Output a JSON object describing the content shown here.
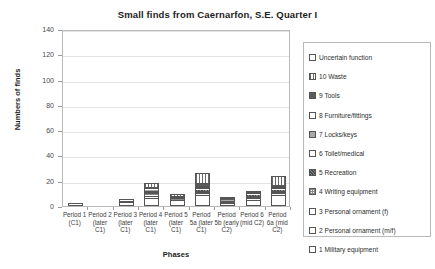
{
  "chart_data": {
    "type": "bar",
    "title": "Small finds from Caernarfon, S.E. Quarter I",
    "xlabel": "Phases",
    "ylabel": "Numbers of finds",
    "ylim": [
      0,
      140
    ],
    "yticks": [
      0,
      20,
      40,
      60,
      80,
      100,
      120,
      140
    ],
    "grid": true,
    "stacked": true,
    "legend_position": "right",
    "categories": [
      "Period 1 (C1)",
      "Period 2 (later C1)",
      "Period 3 (later C1)",
      "Period 4 (later C1)",
      "Period 5 (later C1)",
      "Period 5a (later C1)",
      "Period 5b (early C2)",
      "Period 6 (mid C2)",
      "Period 6a (mid C2)"
    ],
    "series": [
      {
        "name": "1 Military equipment",
        "pattern": "p-empty",
        "values": [
          2,
          0,
          3,
          6,
          5,
          9,
          2,
          5,
          9
        ]
      },
      {
        "name": "2 Personal ornament (m/f)",
        "pattern": "p-empty",
        "values": [
          0,
          0,
          0,
          2,
          0,
          1,
          0,
          1,
          1
        ]
      },
      {
        "name": "3 Personal ornament (f)",
        "pattern": "p-empty",
        "values": [
          0,
          0,
          0,
          1,
          0,
          1,
          0,
          1,
          1
        ]
      },
      {
        "name": "4 Writing equipment",
        "pattern": "p-checker",
        "values": [
          0,
          0,
          1,
          1,
          1,
          1,
          1,
          1,
          1
        ]
      },
      {
        "name": "5 Recreation",
        "pattern": "p-dark-dot",
        "values": [
          0,
          0,
          0,
          1,
          0,
          1,
          0,
          1,
          1
        ]
      },
      {
        "name": "6 Toilet/medical",
        "pattern": "p-empty",
        "values": [
          0,
          0,
          1,
          1,
          1,
          1,
          1,
          1,
          1
        ]
      },
      {
        "name": "7 Locks/keys",
        "pattern": "p-mid",
        "values": [
          0,
          0,
          0,
          1,
          0,
          1,
          1,
          1,
          1
        ]
      },
      {
        "name": "8 Furniture/fittings",
        "pattern": "p-empty",
        "values": [
          0,
          0,
          0,
          1,
          1,
          1,
          0,
          0,
          1
        ]
      },
      {
        "name": "9 Tools",
        "pattern": "p-dark",
        "values": [
          0,
          0,
          0,
          1,
          0,
          2,
          1,
          1,
          1
        ]
      },
      {
        "name": "10 Waste",
        "pattern": "p-vert",
        "values": [
          0,
          0,
          0,
          3,
          1,
          8,
          1,
          0,
          7
        ]
      },
      {
        "name": "Uncertain function",
        "pattern": "p-empty",
        "values": [
          0,
          0,
          0,
          0,
          0,
          0,
          0,
          0,
          0
        ]
      }
    ],
    "totals": [
      2,
      0,
      5,
      18,
      9,
      27,
      8,
      12,
      24
    ]
  },
  "legend": {
    "entries": [
      {
        "label": "Uncertain function",
        "pattern": "p-empty"
      },
      {
        "label": "10 Waste",
        "pattern": "p-vert"
      },
      {
        "label": "9 Tools",
        "pattern": "p-dark"
      },
      {
        "label": "8 Furniture/fittings",
        "pattern": "p-empty"
      },
      {
        "label": "7 Locks/keys",
        "pattern": "p-mid"
      },
      {
        "label": "6 Toilet/medical",
        "pattern": "p-empty"
      },
      {
        "label": "5 Recreation",
        "pattern": "p-dark-dot"
      },
      {
        "label": "4 Writing equipment",
        "pattern": "p-checker"
      },
      {
        "label": "3 Personal ornament (f)",
        "pattern": "p-empty"
      },
      {
        "label": "2 Personal ornament (m/f)",
        "pattern": "p-empty"
      },
      {
        "label": "1 Military equipment",
        "pattern": "p-empty"
      }
    ]
  },
  "colors": {
    "frame": "#b9b9b9",
    "grid": "#e3e3e3",
    "text": "#2e2e2e",
    "bar_outline": "#555555"
  }
}
